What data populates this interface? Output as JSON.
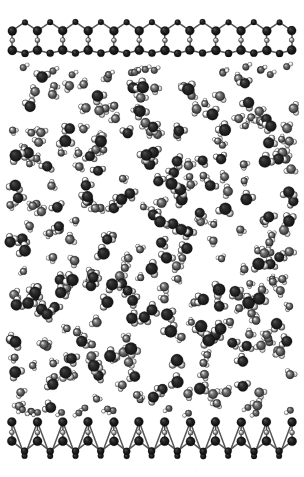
{
  "figure": {
    "render_style": "space-filling spheres, grayscale shaded",
    "background_color": "#ffffff",
    "width": 304,
    "height": 477,
    "caption_artifact": "."
  },
  "colors": {
    "background": "#ffffff",
    "wall_atom_dark": "#141414",
    "wall_atom_mid": "#3a3a3a",
    "wall_bond": "#555555",
    "oxygen_dark": "#1c1c1c",
    "oxygen_mid": "#4a4a4a",
    "hydrogen_light": "#b8b8b8",
    "hydrogen_mid": "#8a8a8a",
    "highlight": "#f2f2f2"
  },
  "top_wall": {
    "label": "upper graphene wall",
    "atom_species": "carbon",
    "lattice": "honeycomb",
    "hexagon_count": 11,
    "y_top": 20,
    "y_bottom": 56,
    "x_start": 12,
    "x_end": 292,
    "atom_radius_large": 4.6,
    "atom_radius_small": 2.6,
    "rows": [
      {
        "name": "apex-row",
        "y": 22,
        "radius": 3.0,
        "shade": "#1c1c1c"
      },
      {
        "name": "upper-ring-row",
        "y": 31,
        "radius": 4.4,
        "shade": "#141414"
      },
      {
        "name": "mid-bridge-row",
        "y": 40,
        "radius": 2.6,
        "shade": "#6a6a6a"
      },
      {
        "name": "lower-ring-row",
        "y": 49,
        "radius": 4.8,
        "shade": "#101010"
      },
      {
        "name": "base-row",
        "y": 52,
        "radius": 3.2,
        "shade": "#1a1a1a"
      }
    ]
  },
  "bottom_wall": {
    "label": "lower graphene wall",
    "atom_species": "carbon",
    "lattice": "honeycomb",
    "hexagon_count": 11,
    "y_top": 418,
    "y_bottom": 458,
    "x_start": 12,
    "x_end": 292,
    "atom_radius_large": 4.6,
    "atom_radius_small": 2.6,
    "rows": [
      {
        "name": "top-row",
        "y": 422,
        "radius": 4.6,
        "shade": "#101010"
      },
      {
        "name": "upper-bridge-row",
        "y": 426,
        "radius": 2.8,
        "shade": "#2a2a2a"
      },
      {
        "name": "mid-row",
        "y": 434,
        "radius": 2.6,
        "shade": "#7a7a7a"
      },
      {
        "name": "lower-ring-row",
        "y": 441,
        "radius": 4.2,
        "shade": "#1c1c1c"
      },
      {
        "name": "base-row",
        "y": 453,
        "radius": 4.4,
        "shade": "#121212"
      }
    ]
  },
  "fluid_region": {
    "label": "confined water",
    "molecule_type": "water",
    "molecule_count": 300,
    "x_min": 8,
    "x_max": 294,
    "y_min": 66,
    "y_max": 414,
    "oxygen_radius": 5.2,
    "hydrogen_radius": 3.1,
    "bond_length": 5.6,
    "depletion_gap_top": 10,
    "depletion_gap_bottom": 6,
    "density_note": "slightly denser toward the center, sparse layer near each wall"
  },
  "render_seed": 20240517
}
